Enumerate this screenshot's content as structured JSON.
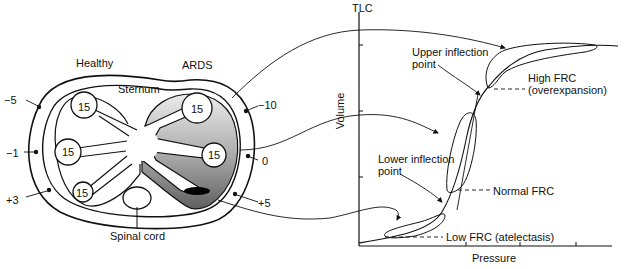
{
  "left_diagram": {
    "title_healthy": "Healthy",
    "title_ards": "ARDS",
    "sternum": "Sternum",
    "spinal_cord": "Spinal cord",
    "alveoli_values": [
      "15",
      "15",
      "15",
      "15",
      "15",
      "15"
    ],
    "pleural_pressures_left": [
      "−5",
      "−1",
      "+3"
    ],
    "pleural_pressures_right": [
      "−10",
      "0",
      "+5"
    ]
  },
  "right_chart": {
    "y_top_label": "TLC",
    "y_axis_label": "Volume",
    "x_axis_label": "Pressure",
    "annotations": {
      "upper_inflection_1": "Upper inflection",
      "upper_inflection_2": "point",
      "lower_inflection_1": "Lower inflection",
      "lower_inflection_2": "point",
      "high_frc_1": "High FRC",
      "high_frc_2": "(overexpansion)",
      "normal_frc": "Normal FRC",
      "low_frc": "Low FRC (atelectasis)"
    }
  },
  "colors": {
    "line": "#111111",
    "ards_gradient_top": "#e6e6e6",
    "ards_gradient_bottom": "#6e6e6e"
  }
}
